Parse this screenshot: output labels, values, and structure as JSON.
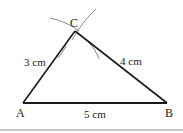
{
  "diagram": {
    "type": "triangle-construction",
    "vertices": {
      "A": {
        "label": "A",
        "x": 23,
        "y": 103
      },
      "B": {
        "label": "B",
        "x": 167,
        "y": 103
      },
      "C": {
        "label": "C",
        "x": 75,
        "y": 31
      }
    },
    "sides": {
      "AB": {
        "label": "5 cm"
      },
      "AC": {
        "label": "3 cm"
      },
      "BC": {
        "label": "4 cm"
      }
    },
    "colors": {
      "line": "#1a1a1a",
      "arc": "#777777",
      "rule": "#c8c8c8"
    }
  }
}
